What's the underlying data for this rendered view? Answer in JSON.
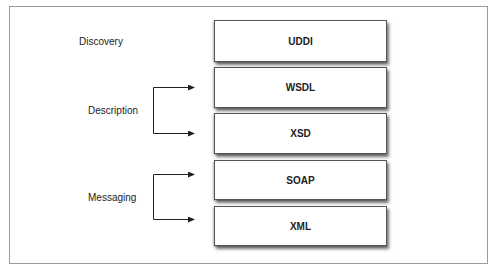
{
  "diagram": {
    "layers": [
      {
        "label": "UDDI",
        "top": 20,
        "height": 42
      },
      {
        "label": "WSDL",
        "top": 67,
        "height": 41
      },
      {
        "label": "XSD",
        "top": 113,
        "height": 41
      },
      {
        "label": "SOAP",
        "top": 160,
        "height": 40
      },
      {
        "label": "XML",
        "top": 206,
        "height": 40
      }
    ],
    "categories": [
      {
        "label": "Discovery"
      },
      {
        "label": "Description"
      },
      {
        "label": "Messaging"
      }
    ]
  }
}
